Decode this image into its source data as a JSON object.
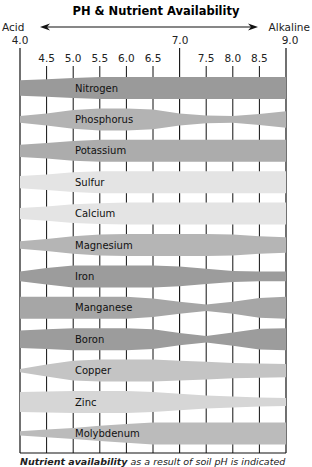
{
  "chart_data": {
    "type": "area",
    "title": "PH & Nutrient Availability",
    "left_label": "Acid",
    "right_label": "Alkaline",
    "x_major_ticks": [
      "4.0",
      "7.0",
      "9.0"
    ],
    "x_minor_ticks": [
      "4.5",
      "5.0",
      "5.5",
      "6.0",
      "6.5",
      "7.5",
      "8.0",
      "8.5"
    ],
    "x": [
      4.0,
      4.5,
      5.0,
      5.5,
      6.0,
      6.5,
      7.0,
      7.5,
      8.0,
      8.5,
      9.0
    ],
    "xlim": [
      4.0,
      9.0
    ],
    "grid": true,
    "value_description": "relative availability (band thickness, 0-1)",
    "series": [
      {
        "name": "Nitrogen",
        "color": "#9a9a9a",
        "values": [
          0.7,
          0.8,
          0.92,
          1.0,
          1.0,
          1.0,
          1.0,
          1.0,
          1.0,
          1.0,
          1.0
        ]
      },
      {
        "name": "Phosphorus",
        "color": "#b3b3b3",
        "values": [
          0.3,
          0.55,
          0.85,
          1.0,
          1.0,
          0.9,
          0.55,
          0.35,
          0.3,
          0.5,
          0.75
        ]
      },
      {
        "name": "Potassium",
        "color": "#acacac",
        "values": [
          0.55,
          0.7,
          0.9,
          1.0,
          1.0,
          1.0,
          1.0,
          1.0,
          1.0,
          1.0,
          1.0
        ]
      },
      {
        "name": "Sulfur",
        "color": "#e4e4e4",
        "values": [
          0.55,
          0.7,
          0.9,
          1.0,
          1.0,
          1.0,
          1.0,
          1.0,
          1.0,
          1.0,
          1.0
        ]
      },
      {
        "name": "Calcium",
        "color": "#e4e4e4",
        "values": [
          0.5,
          0.65,
          0.85,
          0.95,
          1.0,
          1.0,
          1.0,
          1.0,
          1.0,
          1.0,
          1.0
        ]
      },
      {
        "name": "Magnesium",
        "color": "#b5b5b5",
        "values": [
          0.35,
          0.55,
          0.8,
          0.95,
          1.0,
          1.0,
          1.0,
          1.0,
          0.95,
          0.8,
          0.7
        ]
      },
      {
        "name": "Iron",
        "color": "#9c9c9c",
        "values": [
          0.45,
          0.75,
          1.0,
          1.0,
          1.0,
          1.0,
          0.9,
          0.7,
          0.5,
          0.45,
          0.45
        ]
      },
      {
        "name": "Manganese",
        "color": "#a6a6a6",
        "values": [
          1.0,
          1.0,
          1.0,
          1.0,
          1.0,
          0.85,
          0.55,
          0.3,
          0.55,
          0.9,
          1.0
        ]
      },
      {
        "name": "Boron",
        "color": "#9c9c9c",
        "values": [
          0.8,
          0.9,
          1.0,
          1.0,
          1.0,
          0.9,
          0.55,
          0.3,
          0.6,
          0.95,
          1.0
        ]
      },
      {
        "name": "Copper",
        "color": "#c4c4c4",
        "values": [
          0.15,
          0.55,
          0.9,
          1.0,
          1.0,
          1.0,
          0.9,
          0.8,
          0.7,
          0.65,
          0.6
        ]
      },
      {
        "name": "Zinc",
        "color": "#d6d6d6",
        "values": [
          0.9,
          0.95,
          1.0,
          1.0,
          1.0,
          0.9,
          0.75,
          0.6,
          0.5,
          0.4,
          0.35
        ]
      },
      {
        "name": "Molybdenum",
        "color": "#bbbbbb",
        "values": [
          0.2,
          0.35,
          0.5,
          0.7,
          0.85,
          1.0,
          1.0,
          1.0,
          1.0,
          1.0,
          1.0
        ]
      }
    ],
    "caption": "Nutrient availability as a result of soil pH is indicated"
  },
  "header": {
    "title": "PH & Nutrient Availability",
    "left_label": "Acid",
    "right_label": "Alkaline",
    "left_value": "4.0",
    "mid_value": "7.0",
    "right_value": "9.0"
  },
  "caption": {
    "bold": "Nutrient availability",
    "rest": " as a result of soil pH is indicated"
  }
}
